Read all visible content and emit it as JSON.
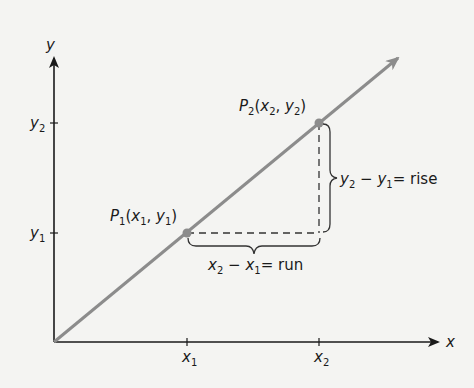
{
  "diagram": {
    "colors": {
      "background": "#f4f4f2",
      "axis": "#1a1a1a",
      "line": "#8c8c8c",
      "point": "#8c8c8c",
      "dashed": "#333333"
    },
    "axes": {
      "x_label": "x",
      "y_label": "y",
      "x_ticks": [
        {
          "base": "x",
          "sub": "1"
        },
        {
          "base": "x",
          "sub": "2"
        }
      ],
      "y_ticks": [
        {
          "base": "y",
          "sub": "1"
        },
        {
          "base": "y",
          "sub": "2"
        }
      ]
    },
    "points": [
      {
        "name": "P",
        "sub": "1",
        "coords_open": "(",
        "x": "x",
        "x_sub": "1",
        "sep": ", ",
        "y": "y",
        "y_sub": "1",
        "coords_close": ")"
      },
      {
        "name": "P",
        "sub": "2",
        "coords_open": "(",
        "x": "x",
        "x_sub": "2",
        "sep": ", ",
        "y": "y",
        "y_sub": "2",
        "coords_close": ")"
      }
    ],
    "run_label": {
      "a": "x",
      "a_sub": "2",
      "minus": " − ",
      "b": "x",
      "b_sub": "1",
      "eq": "= run"
    },
    "rise_label": {
      "a": "y",
      "a_sub": "2",
      "minus": " − ",
      "b": "y",
      "b_sub": "1",
      "eq": "= rise"
    }
  }
}
